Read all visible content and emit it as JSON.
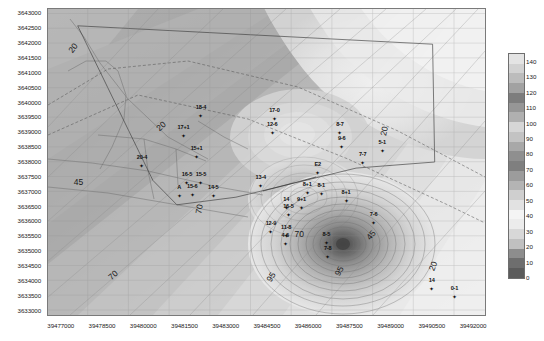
{
  "figure": {
    "kind": "contour-map",
    "xlabel": "",
    "ylabel": ""
  },
  "axes": {
    "x": {
      "min": 39476500,
      "max": 39492400,
      "ticks": [
        "39477000",
        "39478500",
        "39480000",
        "39481500",
        "39483000",
        "39484500",
        "39486000",
        "39487500",
        "39489000",
        "39490500",
        "39492000"
      ],
      "tick_values": [
        39477000,
        39478500,
        39480000,
        39481500,
        39483000,
        39484500,
        39486000,
        39487500,
        39489000,
        39490500,
        39492000
      ]
    },
    "y": {
      "min": 3632850,
      "max": 3643150,
      "ticks": [
        "3643000",
        "3642500",
        "3642000",
        "3641500",
        "3641000",
        "3640500",
        "3640000",
        "3639500",
        "3639000",
        "3638500",
        "3638000",
        "3637500",
        "3637000",
        "3636500",
        "3636000",
        "3635500",
        "3635000",
        "3634500",
        "3634000",
        "3633500",
        "3633000"
      ],
      "tick_values": [
        3643000,
        3642500,
        3642000,
        3641500,
        3641000,
        3640500,
        3640000,
        3639500,
        3639000,
        3638500,
        3638000,
        3637500,
        3637000,
        3636500,
        3636000,
        3635500,
        3635000,
        3634500,
        3634000,
        3633500,
        3633000
      ]
    }
  },
  "colorbar": {
    "orientation": "vertical",
    "min": 0,
    "max": 145,
    "ticks": [
      "140",
      "130",
      "120",
      "110",
      "100",
      "90",
      "80",
      "70",
      "60",
      "50",
      "40",
      "30",
      "20",
      "10",
      "0"
    ],
    "tick_values": [
      140,
      130,
      120,
      110,
      100,
      90,
      80,
      70,
      60,
      50,
      40,
      30,
      20,
      10,
      0
    ],
    "colors": [
      "#5b5b5b",
      "#6e6e6e",
      "#8d8d8d",
      "#c0c0c0",
      "#d8d8d8",
      "#ececec",
      "#f4f4f4",
      "#e2e2e2",
      "#cfcfcf",
      "#b4b4b4",
      "#9c9c9c",
      "#7f7f7f",
      "#8f8f8f",
      "#a8a8a8",
      "#c3c3c3",
      "#d6d6d6",
      "#b0b0b0",
      "#969696",
      "#7d7d7d",
      "#a2a2a2",
      "#bcbcbc",
      "#d2d2d2",
      "#e4e4e4"
    ]
  },
  "contour_labels": [
    {
      "text": "20",
      "x": 0.058,
      "y": 0.128,
      "rot": -52
    },
    {
      "text": "20",
      "x": 0.258,
      "y": 0.383,
      "rot": -42
    },
    {
      "text": "20",
      "x": 0.77,
      "y": 0.4,
      "rot": -78
    },
    {
      "text": "20",
      "x": 0.88,
      "y": 0.84,
      "rot": -68
    },
    {
      "text": "45",
      "x": 0.07,
      "y": 0.565,
      "rot": 0
    },
    {
      "text": "45",
      "x": 0.74,
      "y": 0.74,
      "rot": -50
    },
    {
      "text": "70",
      "x": 0.148,
      "y": 0.87,
      "rot": -42
    },
    {
      "text": "70",
      "x": 0.345,
      "y": 0.655,
      "rot": -80
    },
    {
      "text": "70",
      "x": 0.575,
      "y": 0.735,
      "rot": 0
    },
    {
      "text": "95",
      "x": 0.51,
      "y": 0.875,
      "rot": -58
    },
    {
      "text": "95",
      "x": 0.665,
      "y": 0.855,
      "rot": -62
    }
  ],
  "wells": [
    {
      "label": "18-4",
      "x": 0.35,
      "y": 0.34
    },
    {
      "label": "17+1",
      "x": 0.31,
      "y": 0.405
    },
    {
      "label": "15+1",
      "x": 0.34,
      "y": 0.475
    },
    {
      "label": "20-4",
      "x": 0.215,
      "y": 0.503
    },
    {
      "label": "16-5",
      "x": 0.318,
      "y": 0.558
    },
    {
      "label": "15-5",
      "x": 0.35,
      "y": 0.558
    },
    {
      "label": "A",
      "x": 0.3,
      "y": 0.6
    },
    {
      "label": "15-6",
      "x": 0.33,
      "y": 0.598
    },
    {
      "label": "14-5",
      "x": 0.378,
      "y": 0.6
    },
    {
      "label": "13-4",
      "x": 0.487,
      "y": 0.567
    },
    {
      "label": "17-0",
      "x": 0.518,
      "y": 0.35
    },
    {
      "label": "12-6",
      "x": 0.513,
      "y": 0.395
    },
    {
      "label": "8-7",
      "x": 0.668,
      "y": 0.395
    },
    {
      "label": "9-6",
      "x": 0.672,
      "y": 0.44
    },
    {
      "label": "7-7",
      "x": 0.72,
      "y": 0.493
    },
    {
      "label": "5-1",
      "x": 0.765,
      "y": 0.455
    },
    {
      "label": "E2",
      "x": 0.617,
      "y": 0.525
    },
    {
      "label": "8+1",
      "x": 0.593,
      "y": 0.592
    },
    {
      "label": "9+1",
      "x": 0.58,
      "y": 0.64
    },
    {
      "label": "8+1",
      "x": 0.682,
      "y": 0.618
    },
    {
      "label": "8-1",
      "x": 0.625,
      "y": 0.595
    },
    {
      "label": "14",
      "x": 0.545,
      "y": 0.64
    },
    {
      "label": "16-5",
      "x": 0.55,
      "y": 0.665
    },
    {
      "label": "12-9",
      "x": 0.51,
      "y": 0.718
    },
    {
      "label": "11-8",
      "x": 0.545,
      "y": 0.732
    },
    {
      "label": "4-6",
      "x": 0.543,
      "y": 0.757
    },
    {
      "label": "7-6",
      "x": 0.745,
      "y": 0.69
    },
    {
      "label": "8-5",
      "x": 0.637,
      "y": 0.755
    },
    {
      "label": "7-8",
      "x": 0.64,
      "y": 0.8
    },
    {
      "label": "14",
      "x": 0.878,
      "y": 0.905
    },
    {
      "label": "0-1",
      "x": 0.93,
      "y": 0.93
    }
  ],
  "study_area_polygon": [
    [
      0.068,
      0.055
    ],
    [
      0.88,
      0.115
    ],
    [
      0.885,
      0.5
    ],
    [
      0.705,
      0.52
    ],
    [
      0.43,
      0.615
    ],
    [
      0.295,
      0.64
    ],
    [
      0.24,
      0.56
    ],
    [
      0.068,
      0.055
    ]
  ]
}
